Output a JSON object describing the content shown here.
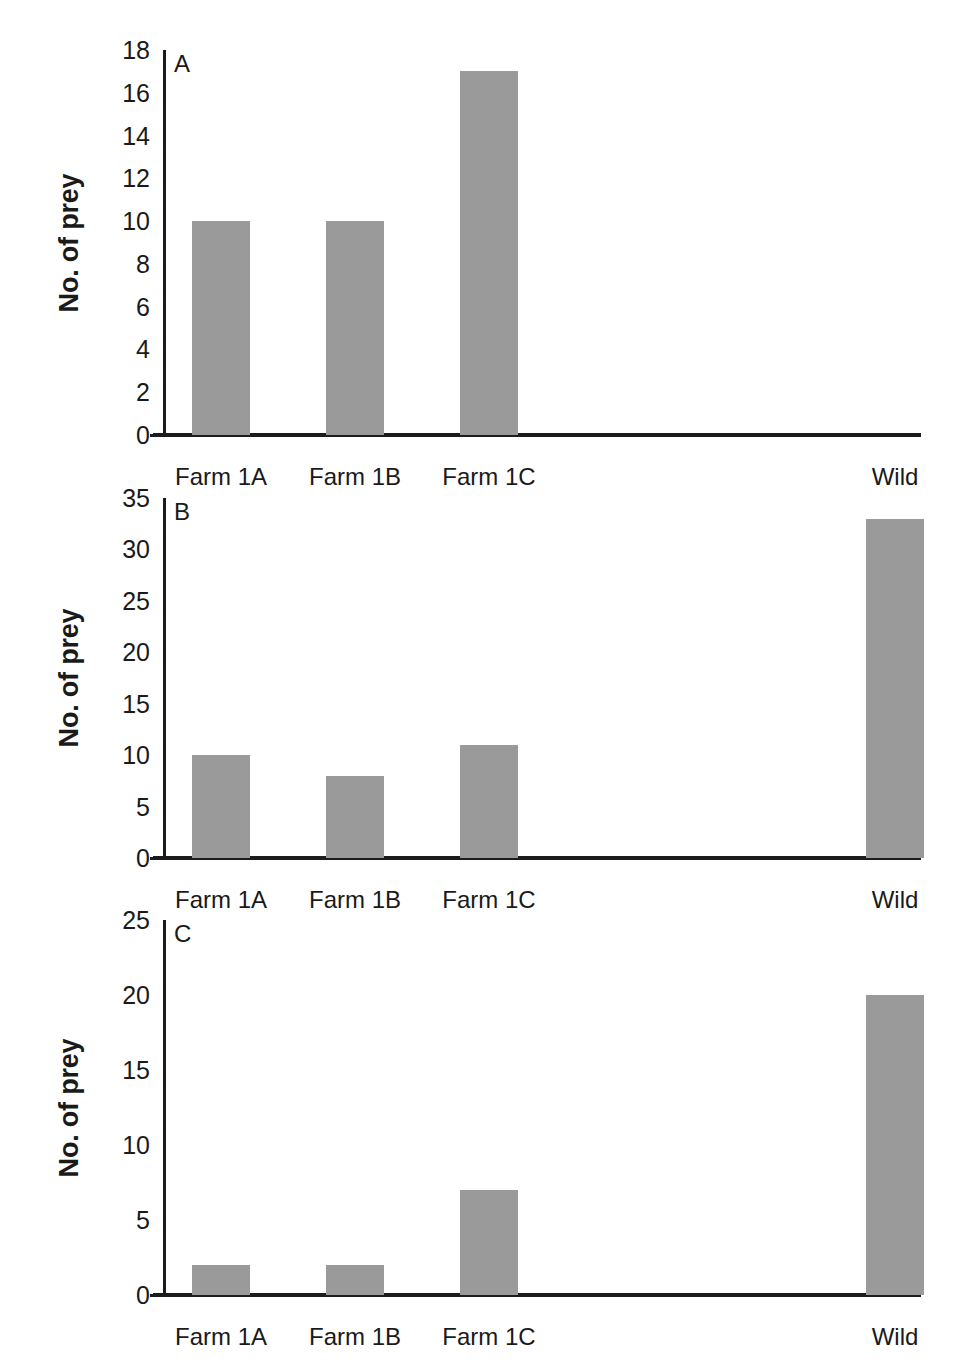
{
  "figure": {
    "background_color": "#ffffff",
    "bar_color": "#9a9a9a",
    "axis_color": "#1c1c1c",
    "categories": [
      "Farm 1A",
      "Farm 1B",
      "Farm 1C",
      "Wild"
    ],
    "axis_title": "No. of prey"
  },
  "chart_data": [
    {
      "type": "bar",
      "panel": "A",
      "title": "",
      "xlabel": "",
      "ylabel": "No. of prey",
      "categories": [
        "Farm 1A",
        "Farm 1B",
        "Farm 1C",
        "Wild"
      ],
      "values": [
        10,
        10,
        17,
        0
      ],
      "ylim": [
        0,
        18
      ],
      "yticks": [
        0,
        2,
        4,
        6,
        8,
        10,
        12,
        14,
        16,
        18
      ],
      "ytick_labels": [
        "0",
        "2",
        "4",
        "6",
        "8",
        "10",
        "12",
        "14",
        "16",
        "18"
      ],
      "grid": false,
      "legend": "none"
    },
    {
      "type": "bar",
      "panel": "B",
      "title": "",
      "xlabel": "",
      "ylabel": "No. of prey",
      "categories": [
        "Farm 1A",
        "Farm 1B",
        "Farm 1C",
        "Wild"
      ],
      "values": [
        10,
        8,
        11,
        33
      ],
      "ylim": [
        0,
        35
      ],
      "yticks": [
        0,
        5,
        10,
        15,
        20,
        25,
        30,
        35
      ],
      "ytick_labels": [
        "0",
        "5",
        "10",
        "15",
        "20",
        "25",
        "30",
        "35"
      ],
      "grid": false,
      "legend": "none"
    },
    {
      "type": "bar",
      "panel": "C",
      "title": "",
      "xlabel": "",
      "ylabel": "No. of prey",
      "categories": [
        "Farm 1A",
        "Farm 1B",
        "Farm 1C",
        "Wild"
      ],
      "values": [
        2,
        2,
        7,
        20
      ],
      "ylim": [
        0,
        25
      ],
      "yticks": [
        0,
        5,
        10,
        15,
        20,
        25
      ],
      "ytick_labels": [
        "0",
        "5",
        "10",
        "15",
        "20",
        "25"
      ],
      "grid": false,
      "legend": "none"
    }
  ],
  "panels": [
    {
      "letter": "A",
      "axis_title": "No. of prey",
      "ytick_labels": [
        "0",
        "2",
        "4",
        "6",
        "8",
        "10",
        "12",
        "14",
        "16",
        "18"
      ],
      "xtick_labels": [
        "Farm 1A",
        "Farm 1B",
        "Farm 1C",
        "Wild"
      ]
    },
    {
      "letter": "B",
      "axis_title": "No. of prey",
      "ytick_labels": [
        "0",
        "5",
        "10",
        "15",
        "20",
        "25",
        "30",
        "35"
      ],
      "xtick_labels": [
        "Farm 1A",
        "Farm 1B",
        "Farm 1C",
        "Wild"
      ]
    },
    {
      "letter": "C",
      "axis_title": "No. of prey",
      "ytick_labels": [
        "0",
        "5",
        "10",
        "15",
        "20",
        "25"
      ],
      "xtick_labels": [
        "Farm 1A",
        "Farm 1B",
        "Farm 1C",
        "Wild"
      ]
    }
  ],
  "layout": {
    "panel_geometry": [
      {
        "plot_left": 163,
        "plot_top": 50,
        "plot_width": 755,
        "plot_height": 385,
        "label_y": 463
      },
      {
        "plot_left": 163,
        "plot_top": 498,
        "plot_width": 755,
        "plot_height": 360,
        "label_y": 886
      },
      {
        "plot_left": 163,
        "plot_top": 920,
        "plot_width": 755,
        "plot_height": 375,
        "label_y": 1323
      }
    ],
    "bar_width": 58,
    "bar_centers": [
      221,
      355,
      489,
      895
    ]
  }
}
